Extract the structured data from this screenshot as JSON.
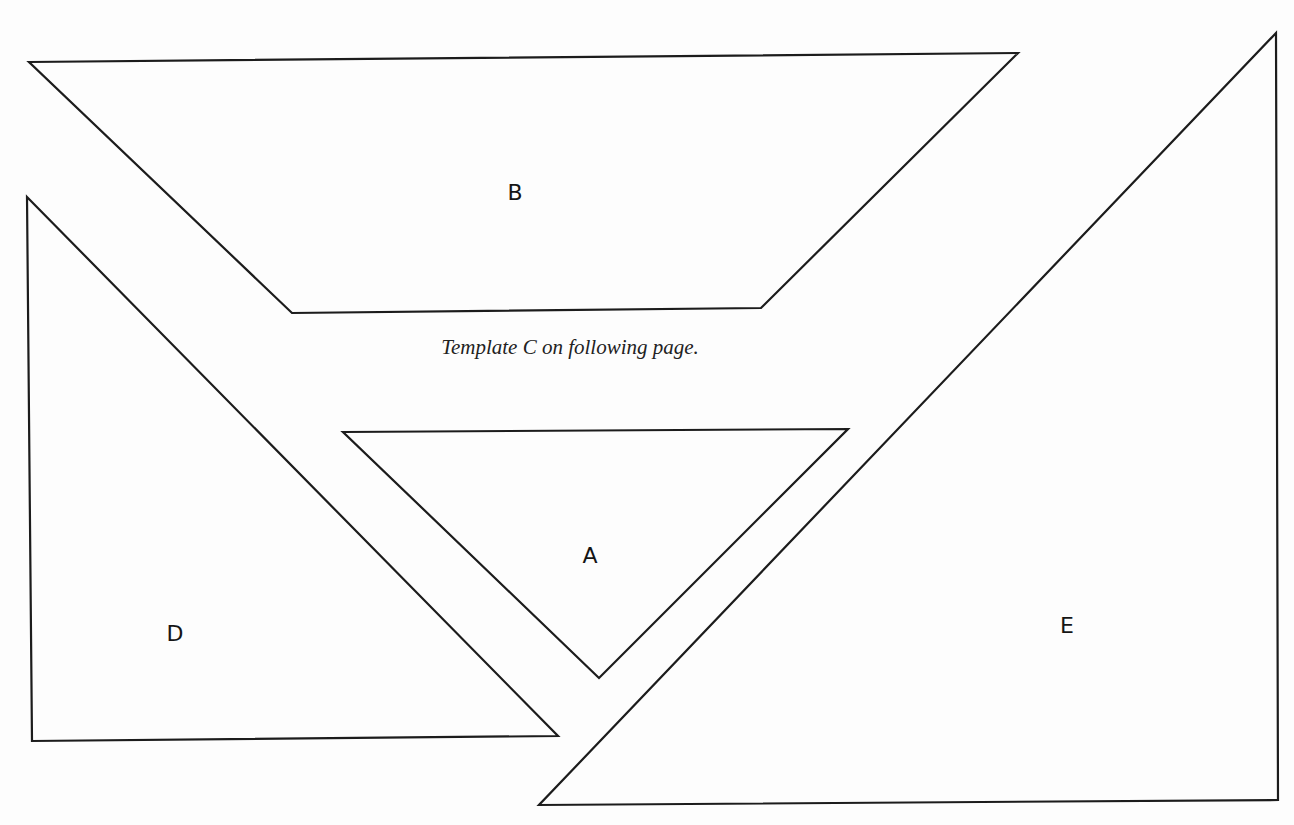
{
  "page": {
    "caption": "Template C on following page.",
    "stroke_color": "#1c1c1c",
    "background_color": "#fdfdfd"
  },
  "templates": [
    {
      "id": "B",
      "label": "B",
      "shape": "trapezoid",
      "points": "29,62 1018,53 761,308 292,313",
      "label_pos": [
        515,
        192
      ]
    },
    {
      "id": "D",
      "label": "D",
      "shape": "right-triangle",
      "points": "27,197 558,736 32,741",
      "label_pos": [
        175,
        633
      ]
    },
    {
      "id": "A",
      "label": "A",
      "shape": "triangle",
      "points": "343,432 848,429 599,678",
      "label_pos": [
        590,
        555
      ]
    },
    {
      "id": "E",
      "label": "E",
      "shape": "right-triangle",
      "points": "1276,33 1278,800 539,805",
      "label_pos": [
        1067,
        625
      ]
    }
  ]
}
